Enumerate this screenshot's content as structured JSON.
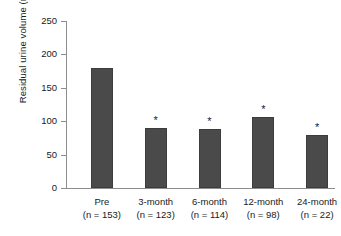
{
  "chart_data": {
    "type": "bar",
    "title": "",
    "subtitle": "",
    "xlabel": "",
    "ylabel": "Residual urine volume (ml)",
    "categories": [
      "Pre",
      "3-month",
      "6-month",
      "12-month",
      "24-month"
    ],
    "group_sizes": [
      "(n = 153)",
      "(n = 123)",
      "(n = 114)",
      "(n = 98)",
      "(n = 22)"
    ],
    "values": [
      180,
      90,
      89,
      106,
      80
    ],
    "annotations": [
      "",
      "*",
      "*",
      "*",
      "*"
    ],
    "ylim": [
      0,
      250
    ],
    "yticks": [
      0,
      50,
      100,
      150,
      200,
      250
    ],
    "ytick_labels": [
      "0",
      "50",
      "100",
      "150",
      "200",
      "250"
    ],
    "grid": false,
    "legend": "none",
    "bar_color": "#4a4a4a",
    "axis_color": "#8d8d8d",
    "text_color": "#1a1a1a",
    "background": "#ffffff"
  }
}
